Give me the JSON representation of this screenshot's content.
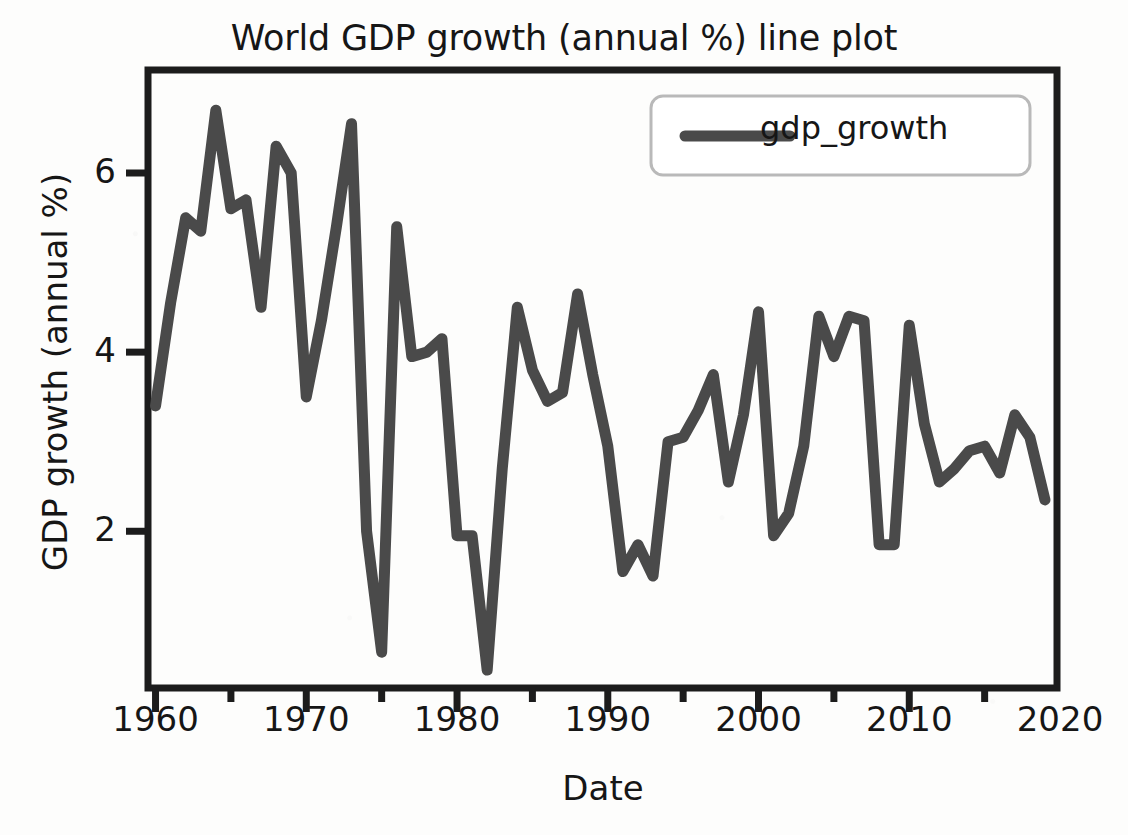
{
  "chart_data": {
    "type": "line",
    "title": "World GDP growth (annual %) line plot",
    "xlabel": "Date",
    "ylabel": "GDP growth (annual %)",
    "xlim": [
      1959.5,
      2019.8
    ],
    "ylim": [
      0.25,
      7.15
    ],
    "grid": false,
    "legend_position": "upper right",
    "xticks": [
      1960,
      1970,
      1980,
      1990,
      2000,
      2010,
      2020
    ],
    "xtick_labels": [
      "1960",
      "1970",
      "1980",
      "1990",
      "2000",
      "2010",
      "2020"
    ],
    "xminor_ticks": [
      1965,
      1975,
      1985,
      1995,
      2005,
      2015
    ],
    "yticks": [
      2,
      4,
      6
    ],
    "ytick_labels": [
      "2",
      "4",
      "6"
    ],
    "series": [
      {
        "name": "gdp_growth",
        "color": "#4a4a4a",
        "linewidth": 11,
        "x": [
          1960,
          1961,
          1962,
          1963,
          1964,
          1965,
          1966,
          1967,
          1968,
          1969,
          1970,
          1971,
          1972,
          1973,
          1974,
          1975,
          1976,
          1977,
          1978,
          1979,
          1980,
          1981,
          1982,
          1983,
          1984,
          1985,
          1986,
          1987,
          1988,
          1989,
          1990,
          1991,
          1992,
          1993,
          1994,
          1995,
          1996,
          1997,
          1998,
          1999,
          2000,
          2001,
          2002,
          2003,
          2004,
          2005,
          2006,
          2007,
          2008,
          2009,
          2010,
          2011,
          2012,
          2013,
          2014,
          2015,
          2016,
          2017,
          2018,
          2019
        ],
        "y": [
          3.4,
          4.55,
          5.5,
          5.35,
          6.7,
          5.6,
          5.7,
          4.5,
          6.3,
          6.0,
          3.5,
          4.35,
          5.4,
          6.55,
          2.0,
          0.65,
          5.4,
          3.95,
          4.0,
          4.15,
          1.95,
          1.95,
          0.45,
          2.7,
          4.5,
          3.8,
          3.45,
          3.55,
          4.65,
          3.75,
          2.95,
          1.55,
          1.85,
          1.5,
          3.0,
          3.05,
          3.35,
          3.75,
          2.55,
          3.3,
          4.45,
          1.95,
          2.2,
          2.95,
          4.4,
          3.95,
          4.4,
          4.35,
          1.85,
          1.85,
          4.3,
          3.2,
          2.55,
          2.7,
          2.9,
          2.95,
          2.65,
          3.3,
          3.05,
          2.35
        ]
      }
    ]
  },
  "legend": {
    "entries": [
      {
        "label": "gdp_growth"
      }
    ]
  }
}
